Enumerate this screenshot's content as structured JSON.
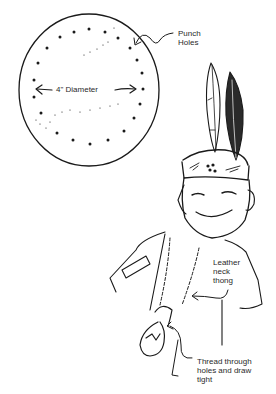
{
  "illustration": {
    "subject": "pouch-craft-instructions",
    "ink_color": "#1a1a1a",
    "paper_color": "#ffffff",
    "labels": {
      "punch_holes": "Punch\nHoles",
      "diameter": "4\" Diameter",
      "leather_thong": "Leather\nneck\nthong",
      "thread_through": "Thread through\nholes and draw\ntight"
    }
  }
}
